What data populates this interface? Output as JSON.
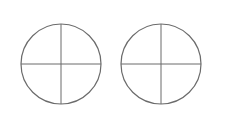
{
  "diagram": {
    "stroke_color": "#6b6b6b",
    "background": "#ffffff",
    "shapes": [
      {
        "id": "circle-left",
        "cx": 61,
        "cy": 64,
        "r": 40,
        "divisions": 4
      },
      {
        "id": "circle-right",
        "cx": 161,
        "cy": 64,
        "r": 40,
        "divisions": 4
      }
    ]
  }
}
